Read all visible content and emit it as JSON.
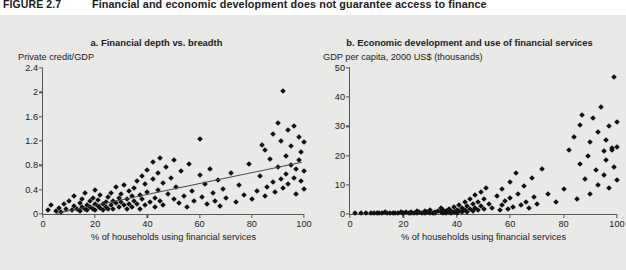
{
  "figure": {
    "number": "FIGURE 2.7",
    "title": "Financial and economic development does not guarantee access to finance"
  },
  "panels": [
    {
      "key": "a",
      "title": "a. Financial depth vs. breadth",
      "ylabel": "Private credit/GDP",
      "xlabel": "% of households using financial services"
    },
    {
      "key": "b",
      "title": "b. Economic development and use of financial services",
      "ylabel": "GDP per capita, 2000 US$ (thousands)",
      "xlabel": "% of households using financial services"
    }
  ],
  "chart_data": [
    {
      "type": "scatter",
      "title": "a. Financial depth vs. breadth",
      "xlabel": "% of households using financial services",
      "ylabel": "Private credit/GDP",
      "xlim": [
        0,
        100
      ],
      "ylim": [
        0,
        2.4
      ],
      "xticks": [
        0,
        20,
        40,
        60,
        80,
        100
      ],
      "yticks": [
        0,
        0.4,
        0.8,
        1.2,
        1.6,
        2.0,
        2.4
      ],
      "grid": false,
      "legend": "none",
      "trendline": {
        "x0": 5,
        "y0": 0.02,
        "x1": 99,
        "y1": 0.86
      },
      "points": [
        [
          2,
          0.07
        ],
        [
          3,
          0.14
        ],
        [
          5,
          0.05
        ],
        [
          6,
          0.1
        ],
        [
          7,
          0.04
        ],
        [
          8,
          0.16
        ],
        [
          9,
          0.08
        ],
        [
          10,
          0.22
        ],
        [
          11,
          0.06
        ],
        [
          12,
          0.13
        ],
        [
          12,
          0.3
        ],
        [
          13,
          0.09
        ],
        [
          14,
          0.18
        ],
        [
          14,
          0.05
        ],
        [
          15,
          0.25
        ],
        [
          15,
          0.12
        ],
        [
          16,
          0.08
        ],
        [
          16,
          0.34
        ],
        [
          17,
          0.15
        ],
        [
          17,
          0.06
        ],
        [
          18,
          0.21
        ],
        [
          18,
          0.11
        ],
        [
          19,
          0.27
        ],
        [
          19,
          0.09
        ],
        [
          20,
          0.17
        ],
        [
          20,
          0.07
        ],
        [
          20,
          0.4
        ],
        [
          21,
          0.13
        ],
        [
          21,
          0.23
        ],
        [
          22,
          0.1
        ],
        [
          22,
          0.31
        ],
        [
          23,
          0.16
        ],
        [
          23,
          0.06
        ],
        [
          24,
          0.2
        ],
        [
          24,
          0.12
        ],
        [
          25,
          0.28
        ],
        [
          25,
          0.09
        ],
        [
          26,
          0.35
        ],
        [
          26,
          0.15
        ],
        [
          27,
          0.22
        ],
        [
          27,
          0.08
        ],
        [
          28,
          0.18
        ],
        [
          28,
          0.44
        ],
        [
          29,
          0.26
        ],
        [
          29,
          0.11
        ],
        [
          30,
          0.33
        ],
        [
          30,
          0.19
        ],
        [
          31,
          0.14
        ],
        [
          31,
          0.47
        ],
        [
          32,
          0.24
        ],
        [
          32,
          0.09
        ],
        [
          33,
          0.37
        ],
        [
          33,
          0.17
        ],
        [
          34,
          0.29
        ],
        [
          34,
          0.12
        ],
        [
          35,
          0.42
        ],
        [
          35,
          0.21
        ],
        [
          36,
          0.55
        ],
        [
          36,
          0.16
        ],
        [
          37,
          0.31
        ],
        [
          37,
          0.08
        ],
        [
          38,
          0.63
        ],
        [
          38,
          0.25
        ],
        [
          39,
          0.49
        ],
        [
          39,
          0.14
        ],
        [
          40,
          0.72
        ],
        [
          40,
          0.36
        ],
        [
          41,
          0.19
        ],
        [
          42,
          0.85
        ],
        [
          42,
          0.58
        ],
        [
          43,
          0.27
        ],
        [
          43,
          0.11
        ],
        [
          44,
          0.68
        ],
        [
          44,
          0.4
        ],
        [
          45,
          0.92
        ],
        [
          45,
          0.22
        ],
        [
          46,
          0.51
        ],
        [
          46,
          0.15
        ],
        [
          47,
          0.77
        ],
        [
          48,
          0.33
        ],
        [
          49,
          0.6
        ],
        [
          50,
          0.24
        ],
        [
          50,
          0.88
        ],
        [
          51,
          0.45
        ],
        [
          52,
          0.18
        ],
        [
          53,
          0.7
        ],
        [
          54,
          0.3
        ],
        [
          55,
          0.12
        ],
        [
          56,
          0.82
        ],
        [
          57,
          0.38
        ],
        [
          58,
          0.21
        ],
        [
          60,
          0.64
        ],
        [
          60,
          1.24
        ],
        [
          61,
          0.28
        ],
        [
          62,
          0.5
        ],
        [
          63,
          0.16
        ],
        [
          64,
          0.74
        ],
        [
          65,
          0.35
        ],
        [
          66,
          0.22
        ],
        [
          67,
          0.56
        ],
        [
          68,
          0.13
        ],
        [
          69,
          0.41
        ],
        [
          70,
          0.26
        ],
        [
          72,
          0.68
        ],
        [
          74,
          0.19
        ],
        [
          75,
          0.47
        ],
        [
          77,
          0.31
        ],
        [
          79,
          0.83
        ],
        [
          80,
          0.24
        ],
        [
          82,
          0.38
        ],
        [
          83,
          0.62
        ],
        [
          84,
          1.14
        ],
        [
          85,
          0.29
        ],
        [
          85,
          1.06
        ],
        [
          86,
          0.45
        ],
        [
          87,
          0.9
        ],
        [
          88,
          0.52
        ],
        [
          88,
          1.32
        ],
        [
          89,
          0.36
        ],
        [
          90,
          0.78
        ],
        [
          90,
          1.5
        ],
        [
          91,
          0.58
        ],
        [
          91,
          1.2
        ],
        [
          92,
          0.42
        ],
        [
          92,
          2.02
        ],
        [
          93,
          0.95
        ],
        [
          93,
          0.66
        ],
        [
          94,
          1.38
        ],
        [
          94,
          0.5
        ],
        [
          95,
          0.81
        ],
        [
          95,
          1.12
        ],
        [
          96,
          0.6
        ],
        [
          96,
          1.44
        ],
        [
          97,
          0.74
        ],
        [
          97,
          0.33
        ],
        [
          98,
          1.26
        ],
        [
          98,
          0.88
        ],
        [
          99,
          1.02
        ],
        [
          99,
          0.55
        ],
        [
          100,
          1.18
        ],
        [
          100,
          0.7
        ],
        [
          100,
          0.41
        ]
      ]
    },
    {
      "type": "scatter",
      "title": "b. Economic development and use of financial services",
      "xlabel": "% of households using financial services",
      "ylabel": "GDP per capita, 2000 US$ (thousands)",
      "xlim": [
        0,
        100
      ],
      "ylim": [
        0,
        50
      ],
      "xticks": [
        0,
        20,
        40,
        60,
        80,
        100
      ],
      "yticks": [
        0,
        10,
        20,
        30,
        40,
        50
      ],
      "grid": false,
      "legend": "none",
      "points": [
        [
          2,
          0.3
        ],
        [
          4,
          0.3
        ],
        [
          6,
          0.4
        ],
        [
          8,
          0.3
        ],
        [
          9,
          0.5
        ],
        [
          10,
          0.3
        ],
        [
          11,
          0.4
        ],
        [
          12,
          0.3
        ],
        [
          13,
          0.6
        ],
        [
          14,
          0.4
        ],
        [
          15,
          0.3
        ],
        [
          16,
          0.5
        ],
        [
          17,
          0.4
        ],
        [
          18,
          0.3
        ],
        [
          19,
          0.7
        ],
        [
          20,
          0.4
        ],
        [
          20,
          0.3
        ],
        [
          21,
          0.6
        ],
        [
          22,
          0.4
        ],
        [
          23,
          0.8
        ],
        [
          23,
          0.3
        ],
        [
          24,
          0.5
        ],
        [
          25,
          0.4
        ],
        [
          25,
          1.0
        ],
        [
          26,
          0.6
        ],
        [
          27,
          0.4
        ],
        [
          28,
          0.9
        ],
        [
          28,
          0.3
        ],
        [
          29,
          0.7
        ],
        [
          30,
          0.5
        ],
        [
          30,
          1.2
        ],
        [
          31,
          0.4
        ],
        [
          32,
          0.8
        ],
        [
          32,
          0.3
        ],
        [
          33,
          1.0
        ],
        [
          34,
          0.6
        ],
        [
          34,
          2.1
        ],
        [
          35,
          0.4
        ],
        [
          35,
          1.4
        ],
        [
          36,
          0.9
        ],
        [
          36,
          0.3
        ],
        [
          37,
          1.7
        ],
        [
          37,
          0.6
        ],
        [
          38,
          1.1
        ],
        [
          38,
          0.4
        ],
        [
          39,
          2.4
        ],
        [
          39,
          0.8
        ],
        [
          40,
          1.5
        ],
        [
          40,
          0.5
        ],
        [
          41,
          3.0
        ],
        [
          41,
          1.0
        ],
        [
          42,
          2.0
        ],
        [
          42,
          0.6
        ],
        [
          43,
          4.2
        ],
        [
          43,
          1.3
        ],
        [
          44,
          2.6
        ],
        [
          44,
          0.8
        ],
        [
          45,
          5.0
        ],
        [
          45,
          1.8
        ],
        [
          46,
          3.4
        ],
        [
          46,
          1.0
        ],
        [
          47,
          6.5
        ],
        [
          47,
          2.2
        ],
        [
          48,
          4.0
        ],
        [
          48,
          1.2
        ],
        [
          49,
          7.6
        ],
        [
          49,
          2.8
        ],
        [
          50,
          5.2
        ],
        [
          50,
          1.6
        ],
        [
          51,
          9.0
        ],
        [
          52,
          3.5
        ],
        [
          53,
          2.0
        ],
        [
          55,
          6.0
        ],
        [
          56,
          1.4
        ],
        [
          57,
          8.4
        ],
        [
          57,
          3.2
        ],
        [
          58,
          4.6
        ],
        [
          59,
          1.8
        ],
        [
          60,
          11.0
        ],
        [
          60,
          5.5
        ],
        [
          61,
          2.4
        ],
        [
          62,
          14.0
        ],
        [
          63,
          7.0
        ],
        [
          64,
          3.0
        ],
        [
          65,
          9.5
        ],
        [
          66,
          4.2
        ],
        [
          67,
          2.0
        ],
        [
          68,
          12.5
        ],
        [
          69,
          5.8
        ],
        [
          70,
          3.4
        ],
        [
          72,
          15.5
        ],
        [
          74,
          6.8
        ],
        [
          77,
          4.0
        ],
        [
          80,
          8.5
        ],
        [
          82,
          22.0
        ],
        [
          84,
          26.5
        ],
        [
          85,
          5.0
        ],
        [
          86,
          30.5
        ],
        [
          86,
          17.0
        ],
        [
          87,
          34.0
        ],
        [
          88,
          12.0
        ],
        [
          89,
          20.0
        ],
        [
          90,
          24.5
        ],
        [
          90,
          7.0
        ],
        [
          91,
          33.0
        ],
        [
          92,
          15.0
        ],
        [
          93,
          28.0
        ],
        [
          93,
          10.0
        ],
        [
          94,
          36.5
        ],
        [
          95,
          21.5
        ],
        [
          95,
          13.5
        ],
        [
          96,
          25.5
        ],
        [
          96,
          18.5
        ],
        [
          97,
          30.0
        ],
        [
          97,
          9.0
        ],
        [
          98,
          22.5
        ],
        [
          98,
          22.0
        ],
        [
          99,
          47.0
        ],
        [
          99,
          16.0
        ],
        [
          100,
          31.5
        ],
        [
          100,
          23.0
        ],
        [
          100,
          11.5
        ]
      ]
    }
  ]
}
